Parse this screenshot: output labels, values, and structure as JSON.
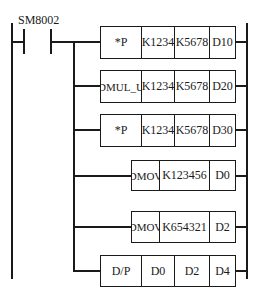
{
  "diagram": {
    "type": "ladder",
    "contact": {
      "label": "SM8002",
      "kind": "normally-open"
    },
    "rungs": [
      {
        "cells": [
          "*P",
          "K1234",
          "K5678",
          "D10"
        ]
      },
      {
        "cells": [
          "DMUL_U",
          "K1234",
          "K5678",
          "D20"
        ]
      },
      {
        "cells": [
          "*P",
          "K1234",
          "K5678",
          "D30"
        ]
      },
      {
        "cells": [
          "DMOV",
          "K123456",
          "D0"
        ]
      },
      {
        "cells": [
          "DMOV",
          "K654321",
          "D2"
        ]
      },
      {
        "cells": [
          "D/P",
          "D0",
          "D2",
          "D4"
        ]
      }
    ]
  }
}
